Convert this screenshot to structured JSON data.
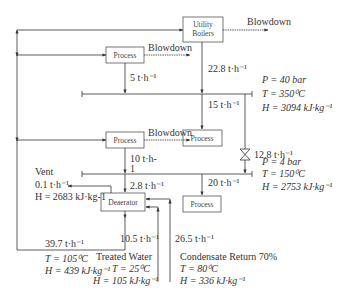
{
  "diagram": {
    "boxes": {
      "utility_boilers_line1": "Utility",
      "utility_boilers_line2": "Boilers",
      "process_hp": "Process",
      "process_hp_use": "Process",
      "process_lp": "Process",
      "process_lp_use": "Process",
      "deaerator": "Deaerator"
    },
    "blowdown_boilers": "Blowdown",
    "blowdown_process_hp": "Blowdown",
    "blowdown_process_lp": "Blowdown",
    "flows": {
      "hp_process_flow": "5 t·h⁻¹",
      "boiler_steam": "22.8 t·h⁻¹",
      "hp_use": "15 t·h⁻¹",
      "letdown": "12.8 t·h⁻¹",
      "lp_process_flow": "10 t·h-",
      "lp_process_flow_cont": "1",
      "deaerator_steam": "2.8 t·h⁻¹",
      "lp_use": "20 t·h⁻¹",
      "bfw": "39.7 t·h⁻¹",
      "treated_water_flow": "10.5 t·h⁻¹",
      "condensate_flow": "26.5 t·h⁻¹"
    },
    "hp_header": {
      "P": "P = 40 bar",
      "T": "T = 350⁰C",
      "H": "H = 3094 kJ·kg⁻¹"
    },
    "lp_header": {
      "P": "P = 4 bar",
      "T": "T = 150⁰C",
      "H": "H = 2753 kJ·kg⁻¹"
    },
    "vent": {
      "label": "Vent",
      "flow": "0.1 t·h⁻¹",
      "H": "H = 2683 kJ·kg-1"
    },
    "bfw_props": {
      "T": "T = 105⁰C",
      "H": "H = 439 kJ·kg⁻¹"
    },
    "treated_water": {
      "label": "Treated Water",
      "T": "T = 25⁰C",
      "H": "H = 105 kJ·kg⁻¹"
    },
    "condensate": {
      "label": "Condensate Return 70%",
      "T": "T = 80⁰C",
      "H": "H = 336 kJ·kg⁻¹"
    }
  }
}
